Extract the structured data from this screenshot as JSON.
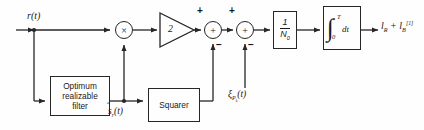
{
  "diagram": {
    "type": "signal-flow-block-diagram",
    "stroke_color": "#262626",
    "background_color": "#fefefe",
    "text_color": "#1a1a1a"
  },
  "labels": {
    "input_signal": "r(t)",
    "filter_output": "ŝr(t)",
    "bias_input": "ξPₖ(t)",
    "output": "lR + lB[1]"
  },
  "blocks": [
    {
      "id": "optimum-filter",
      "label": "Optimum realizable filter",
      "x": 50,
      "y": 76,
      "w": 60,
      "h": 40
    },
    {
      "id": "squarer",
      "label": "Squarer",
      "x": 148,
      "y": 88,
      "w": 52,
      "h": 34
    },
    {
      "id": "gain-normalizer",
      "label": "1/N₀",
      "numerator": "1",
      "denominator": "N₀",
      "x": 273,
      "y": 11,
      "w": 24,
      "h": 38
    },
    {
      "id": "integrator",
      "label": "∫0T dt",
      "lower_limit": "0",
      "upper_limit": "T",
      "differential": "dt",
      "x": 323,
      "y": 6,
      "w": 38,
      "h": 44
    }
  ],
  "nodes": [
    {
      "id": "multiplier",
      "symbol": "×",
      "x": 115,
      "y": 21,
      "d": 18
    },
    {
      "id": "summer-1",
      "symbol": "+",
      "x": 204,
      "y": 21,
      "d": 18
    },
    {
      "id": "summer-2",
      "symbol": "+",
      "x": 236,
      "y": 21,
      "d": 18
    }
  ],
  "amplifier": {
    "id": "amplifier",
    "gain": "2",
    "x": 160,
    "y": 13,
    "w": 34,
    "h": 34
  },
  "signs": [
    {
      "id": "summer-1-plus",
      "text": "+",
      "x": 197,
      "y": 6
    },
    {
      "id": "summer-1-minus",
      "text": "−",
      "x": 215,
      "y": 41
    },
    {
      "id": "summer-2-plus",
      "text": "+",
      "x": 229,
      "y": 6
    },
    {
      "id": "summer-2-minus",
      "text": "−",
      "x": 247,
      "y": 41
    }
  ]
}
